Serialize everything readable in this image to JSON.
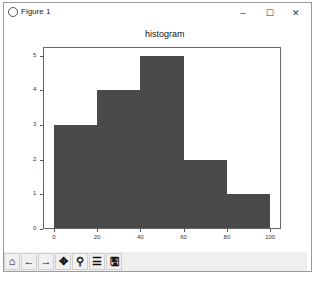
{
  "window": {
    "title": "Figure 1",
    "controls": {
      "minimize": "–",
      "maximize": "☐",
      "close": "✕"
    }
  },
  "toolbar": {
    "items": [
      {
        "name": "home",
        "glyph": "⌂"
      },
      {
        "name": "back",
        "glyph": "←"
      },
      {
        "name": "forward",
        "glyph": "→"
      },
      {
        "name": "pan",
        "glyph": "✥"
      },
      {
        "name": "zoom",
        "glyph": "⚲"
      },
      {
        "name": "configure-subplots",
        "glyph": "☰"
      },
      {
        "name": "save",
        "glyph": "🖫"
      }
    ]
  },
  "chart_data": {
    "type": "bar",
    "title": "histogram",
    "xlabel": "",
    "ylabel": "",
    "bins": [
      [
        0,
        20
      ],
      [
        20,
        40
      ],
      [
        40,
        60
      ],
      [
        60,
        80
      ],
      [
        80,
        100
      ]
    ],
    "categories": [
      "0-20",
      "20-40",
      "40-60",
      "60-80",
      "80-100"
    ],
    "values": [
      3,
      4,
      5,
      2,
      1
    ],
    "xticks": [
      "0",
      "20",
      "40",
      "60",
      "80",
      "100"
    ],
    "yticks": [
      "0",
      "1",
      "2",
      "3",
      "4",
      "5"
    ],
    "xlim": [
      -5,
      105
    ],
    "ylim": [
      0,
      5.25
    ],
    "bar_color": "#4a4a4a",
    "grid": false,
    "legend": null
  }
}
